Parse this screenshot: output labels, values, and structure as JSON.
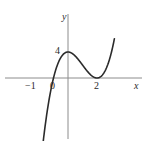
{
  "figure": {
    "name": "cubic-function-graph",
    "background_color": "#ffffff",
    "axis_color": "#8c8c8c",
    "curve_color": "#2b2b2b"
  },
  "axes": {
    "x_label": "x",
    "y_label": "y",
    "x_axis_pixel_y": 78,
    "y_axis_pixel_x": 68,
    "x_axis_span_px": [
      5,
      142
    ],
    "y_axis_span_px": [
      14,
      139
    ]
  },
  "ticks": {
    "x": [
      {
        "label": "−1",
        "value": -1
      },
      {
        "label": "0",
        "value": 0
      },
      {
        "label": "2",
        "value": 2
      }
    ],
    "y": [
      {
        "label": "4",
        "value": 4
      }
    ]
  },
  "chart_data": {
    "type": "line",
    "title": "",
    "xlabel": "x",
    "ylabel": "y",
    "grid": false,
    "legend": null,
    "xlim": [
      -1.8,
      3.2
    ],
    "ylim": [
      -7.5,
      9.5
    ],
    "xticks": [
      -1,
      0,
      2
    ],
    "xticklabels": [
      "−1",
      "0",
      "2"
    ],
    "yticks": [
      4
    ],
    "yticklabels": [
      "4"
    ],
    "series": [
      {
        "name": "y = (x + 1)(x − 2)²",
        "roots": [
          -1,
          2
        ],
        "double_root": 2,
        "local_maximum": {
          "x": 0,
          "y": 4
        },
        "local_minimum": {
          "x": 2,
          "y": 0
        },
        "y_intercept": 4,
        "x": [
          -1.8,
          -1.6,
          -1.4,
          -1.2,
          -1.0,
          -0.8,
          -0.6,
          -0.4,
          -0.2,
          0.0,
          0.2,
          0.4,
          0.6,
          0.8,
          1.0,
          1.2,
          1.4,
          1.6,
          1.8,
          2.0,
          2.2,
          2.4,
          2.6,
          2.8,
          3.0,
          3.2
        ],
        "y": [
          -11.97,
          -8.64,
          -5.78,
          -3.39,
          -1.6,
          -0.6,
          0.0,
          0.0,
          0.0,
          4.0,
          3.89,
          3.58,
          3.14,
          2.59,
          2.0,
          1.41,
          0.86,
          0.42,
          0.13,
          0.0,
          0.13,
          0.54,
          1.3,
          2.5,
          4.0,
          6.19
        ]
      }
    ]
  },
  "curve_path": "M 40,141 C 43,125 47,105 52,92 C 57,79 62,70 68,65 C 72,61.5 76,60.5 80,61 C 87,62 92,68 97,73 C 101,76.5 104,78 108,78 C 112,78 115,75 118,68 C 121,60 124,44 128,20 L 131,0"
}
